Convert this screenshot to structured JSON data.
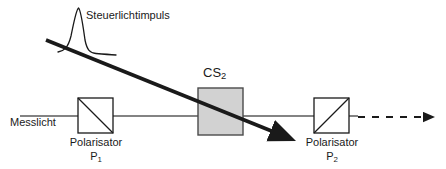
{
  "figure": {
    "title_alt": "Optischer Kerr-Effekt Schema",
    "width": 446,
    "height": 169,
    "background_color": "#ffffff"
  },
  "labels": {
    "messlicht": "Messlicht",
    "steuerlichtimpuls": "Steuerlichtimpuls",
    "cs2_main": "CS",
    "cs2_sub": "2",
    "polarisator1_name": "Polarisator",
    "polarisator1_sub_main": "P",
    "polarisator1_sub_index": "1",
    "polarisator2_name": "Polarisator",
    "polarisator2_sub_main": "P",
    "polarisator2_sub_index": "2"
  },
  "colors": {
    "line": "#1a1a1a",
    "beam": "#5a5a5a",
    "cell_fill": "#d2d2d2",
    "cell_stroke": "#4a4a4a",
    "box_stroke": "#1a1a1a",
    "pulse_stroke": "#1a1a1a"
  },
  "elements": {
    "measuring_beam": {
      "type": "horizontal-line",
      "x_start": 20,
      "x_end": 358,
      "y": 116
    },
    "polariser_1_box": {
      "x": 78,
      "y": 98,
      "width": 35,
      "height": 35,
      "diagonal": "top-left-to-bottom-right"
    },
    "kerr_cell": {
      "x": 198,
      "y": 88,
      "width": 45,
      "height": 47,
      "fill": "#d2d2d2"
    },
    "polariser_2_box": {
      "x": 314,
      "y": 98,
      "width": 35,
      "height": 35,
      "diagonal": "bottom-left-to-top-right"
    },
    "control_pulse_arrow": {
      "type": "thick-diagonal-arrow",
      "x_start": 46,
      "y_start": 40,
      "x_end": 282,
      "y_end": 136
    },
    "pulse_curve": {
      "type": "gaussian-peak",
      "peak_x": 78,
      "peak_y": 8,
      "baseline_y": 52
    },
    "output_dashed_arrow": {
      "type": "dashed-arrow",
      "x_start": 358,
      "x_end": 432,
      "y": 117
    }
  }
}
